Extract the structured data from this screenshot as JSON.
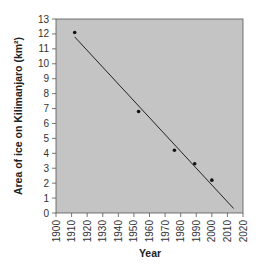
{
  "chart_data": {
    "type": "scatter",
    "title": "",
    "xlabel": "Year",
    "ylabel": "Area of ice on Kilimanjaro (km²)",
    "xlim": [
      1900,
      2020
    ],
    "ylim": [
      0,
      13
    ],
    "x_ticks": [
      1900,
      1910,
      1920,
      1930,
      1940,
      1950,
      1960,
      1970,
      1980,
      1990,
      2000,
      2010,
      2020
    ],
    "y_ticks": [
      0,
      1,
      2,
      3,
      4,
      5,
      6,
      7,
      8,
      9,
      10,
      11,
      12,
      13
    ],
    "grid": false,
    "legend": null,
    "background": "#c4c4c4",
    "series": [
      {
        "name": "Observed ice area",
        "kind": "points",
        "x": [
          1912,
          1953,
          1976,
          1989,
          2000
        ],
        "y": [
          12.1,
          6.8,
          4.2,
          3.3,
          2.2
        ]
      },
      {
        "name": "Trend line",
        "kind": "line",
        "x": [
          1912,
          2014
        ],
        "y": [
          11.8,
          0.3
        ]
      }
    ]
  }
}
